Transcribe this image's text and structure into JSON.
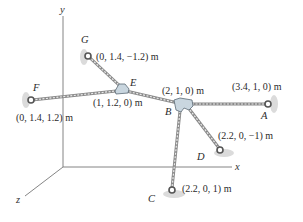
{
  "axes": {
    "x_label": "x",
    "y_label": "y",
    "z_label": "z"
  },
  "points": {
    "A": {
      "label": "A",
      "coords": "(3.4, 1, 0) m"
    },
    "B": {
      "label": "B",
      "coords": "(2, 1, 0) m"
    },
    "C": {
      "label": "C",
      "coords": "(2.2, 0, 1) m"
    },
    "D": {
      "label": "D",
      "coords": "(2.2, 0, −1) m"
    },
    "E": {
      "label": "E",
      "coords": "(1, 1.2, 0) m"
    },
    "F": {
      "label": "F",
      "coords": "(0, 1.4, 1.2) m"
    },
    "G": {
      "label": "G",
      "coords": "(0, 1.4, −1.2) m"
    }
  },
  "cables": [
    {
      "from": "G",
      "to": "E"
    },
    {
      "from": "F",
      "to": "E"
    },
    {
      "from": "E",
      "to": "B"
    },
    {
      "from": "B",
      "to": "A"
    },
    {
      "from": "B",
      "to": "D"
    },
    {
      "from": "B",
      "to": "C"
    }
  ],
  "colors": {
    "cable": "#8a8a8a",
    "connector": "#c9d6df",
    "wall_shadow": "#cfcfcf",
    "text": "#2a2a2a"
  }
}
